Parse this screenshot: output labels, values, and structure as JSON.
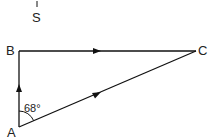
{
  "diagram": {
    "north_label": "S",
    "points": {
      "A": {
        "label": "A",
        "x": 19,
        "y": 127
      },
      "B": {
        "label": "B",
        "x": 19,
        "y": 51
      },
      "C": {
        "label": "C",
        "x": 196,
        "y": 51
      }
    },
    "angle_label": "68°",
    "stroke_color": "#111111"
  }
}
